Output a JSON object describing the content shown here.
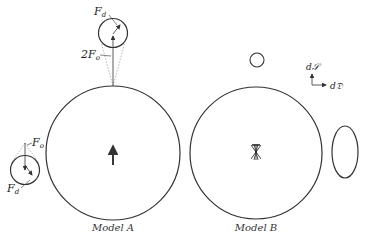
{
  "figure": {
    "models": [
      {
        "caption": "Model A",
        "labels": {
          "top_force_d": "F",
          "top_force_d_sub": "d",
          "top_force_o": "2F",
          "top_force_o_sub": "o",
          "left_force_o": "F",
          "left_force_o_sub": "o",
          "left_force_d": "F",
          "left_force_d_sub": "d"
        }
      },
      {
        "caption": "Model B"
      }
    ],
    "axes": {
      "vertical_label": "d𝒮",
      "horizontal_label": "d𝔇"
    },
    "colors": {
      "stroke": "#333333",
      "background": "#ffffff"
    }
  }
}
